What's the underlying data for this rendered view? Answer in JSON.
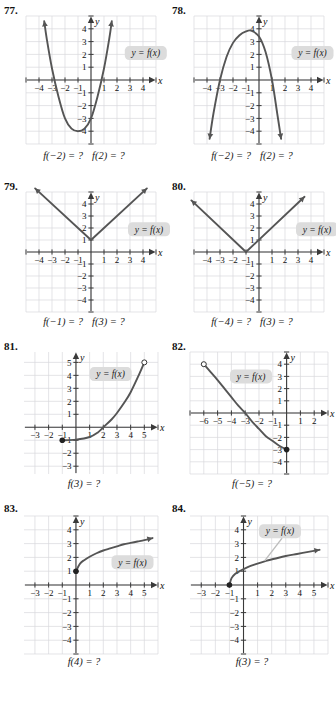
{
  "page": {
    "background": "#ffffff",
    "curve_color": "#555555",
    "grid_color": "#d8d8dc",
    "axis_color": "#3a3a3a",
    "callout_bg": "#dcdcdc",
    "columns": 2,
    "rows": 4
  },
  "label_text": "y = f(x)",
  "axis_names": {
    "x": "x",
    "y": "y"
  },
  "exercises": [
    {
      "number": "77.",
      "caption_parts": [
        "f(−2) = ?",
        "f(2) = ?"
      ],
      "axis_x_ticks": [
        "−4",
        "−3",
        "−2",
        "−1",
        "1",
        "2",
        "3",
        "4"
      ],
      "axis_y_ticks": [
        "4",
        "3",
        "2",
        "1",
        "−1",
        "−2",
        "−3",
        "−4"
      ],
      "chart_data": {
        "type": "line",
        "title": "Exercise 77 graph",
        "xlabel": "x",
        "ylabel": "y",
        "xlim": [
          -5,
          5
        ],
        "ylim": [
          -5,
          5
        ],
        "grid": true,
        "shape": "upward parabola, vertex near (-1, -4), roots at x = -3 and x = 1",
        "points": [
          [
            -3.6,
            4.6
          ],
          [
            -3.4,
            3.2
          ],
          [
            -3,
            0.9
          ],
          [
            -2.5,
            -1.3
          ],
          [
            -2,
            -3.0
          ],
          [
            -1.5,
            -3.8
          ],
          [
            -1,
            -4.0
          ],
          [
            -0.5,
            -3.8
          ],
          [
            0,
            -3.0
          ],
          [
            0.5,
            -1.3
          ],
          [
            1,
            0.9
          ],
          [
            1.4,
            3.2
          ],
          [
            1.6,
            4.6
          ]
        ],
        "arrows": [
          "start",
          "end"
        ],
        "label": "y = f(x)",
        "label_pos": [
          2.6,
          2.1
        ]
      }
    },
    {
      "number": "78.",
      "caption_parts": [
        "f(−2) = ?",
        "f(2) = ?"
      ],
      "axis_x_ticks": [
        "−4",
        "−3",
        "−2",
        "−1",
        "1",
        "2",
        "3",
        "4"
      ],
      "axis_y_ticks": [
        "4",
        "3",
        "2",
        "1",
        "−1",
        "−2",
        "−3",
        "−4"
      ],
      "chart_data": {
        "type": "line",
        "title": "Exercise 78 graph",
        "xlabel": "x",
        "ylabel": "y",
        "xlim": [
          -5,
          5
        ],
        "ylim": [
          -5,
          5
        ],
        "grid": true,
        "shape": "downward parabola, vertex near (-0.6, 3.8), roots at x = -3 and x = 1",
        "points": [
          [
            -3.8,
            -4.6
          ],
          [
            -3.5,
            -2.6
          ],
          [
            -3,
            0.0
          ],
          [
            -2.5,
            1.8
          ],
          [
            -2,
            2.9
          ],
          [
            -1.5,
            3.5
          ],
          [
            -1,
            3.8
          ],
          [
            -0.6,
            3.85
          ],
          [
            0,
            3.4
          ],
          [
            0.5,
            2.2
          ],
          [
            1,
            0.0
          ],
          [
            1.4,
            -2.6
          ],
          [
            1.7,
            -4.6
          ]
        ],
        "arrows": [
          "start",
          "end"
        ],
        "label": "y = f(x)",
        "label_pos": [
          2.5,
          2.1
        ]
      }
    },
    {
      "number": "79.",
      "caption_parts": [
        "f(−1) = ?",
        "f(3) = ?"
      ],
      "axis_x_ticks": [
        "−4",
        "−3",
        "−2",
        "−1",
        "1",
        "2",
        "3",
        "4"
      ],
      "axis_y_ticks": [
        "4",
        "3",
        "2",
        "1",
        "−1",
        "−2",
        "−3",
        "−4"
      ],
      "chart_data": {
        "type": "line",
        "title": "Exercise 79 graph",
        "xlabel": "x",
        "ylabel": "y",
        "xlim": [
          -5,
          5
        ],
        "ylim": [
          -5,
          5
        ],
        "grid": true,
        "shape": "absolute value V with vertex at (0, 1)",
        "points": [
          [
            -4.3,
            5.3
          ],
          [
            0,
            1
          ],
          [
            4.3,
            5.3
          ]
        ],
        "vertex": [
          0,
          1
        ],
        "arrows": [
          "start",
          "end"
        ],
        "label": "y = f(x)",
        "label_pos": [
          3.0,
          1.9
        ]
      }
    },
    {
      "number": "80.",
      "caption_parts": [
        "f(−4) = ?",
        "f(3) = ?"
      ],
      "axis_x_ticks": [
        "−4",
        "−3",
        "−2",
        "−1",
        "1",
        "2",
        "3",
        "4"
      ],
      "axis_y_ticks": [
        "4",
        "3",
        "2",
        "1",
        "−1",
        "−2",
        "−3",
        "−4"
      ],
      "chart_data": {
        "type": "line",
        "title": "Exercise 80 graph",
        "xlabel": "x",
        "ylabel": "y",
        "xlim": [
          -5,
          5
        ],
        "ylim": [
          -5,
          5
        ],
        "grid": true,
        "shape": "absolute value V with vertex at (-1, 0)",
        "points": [
          [
            -5.2,
            4.3
          ],
          [
            -1,
            0
          ],
          [
            3.5,
            4.6
          ]
        ],
        "vertex": [
          -1,
          0
        ],
        "arrows": [
          "start",
          "end"
        ],
        "label": "y = f(x)",
        "label_pos": [
          3.0,
          1.9
        ]
      }
    },
    {
      "number": "81.",
      "caption_parts": [
        "f(3) = ?"
      ],
      "axis_x_ticks": [
        "−3",
        "−2",
        "−1",
        "1",
        "2",
        "3",
        "4",
        "5"
      ],
      "axis_y_ticks": [
        "5",
        "4",
        "3",
        "2",
        "1",
        "−1",
        "−2",
        "−3"
      ],
      "chart_data": {
        "type": "line",
        "title": "Exercise 81 graph",
        "xlabel": "x",
        "ylabel": "y",
        "xlim": [
          -3.8,
          6
        ],
        "ylim": [
          -3.6,
          5.8
        ],
        "grid": true,
        "shape": "increasing exponential-like curve from closed point (-1,-1) to open point (5,5)",
        "points": [
          [
            -1,
            -1
          ],
          [
            0,
            -0.95
          ],
          [
            1,
            -0.75
          ],
          [
            1.6,
            -0.4
          ],
          [
            2,
            0.0
          ],
          [
            2.6,
            0.6
          ],
          [
            3,
            1.1
          ],
          [
            3.6,
            2.0
          ],
          [
            4,
            2.7
          ],
          [
            4.5,
            3.8
          ],
          [
            5,
            5
          ]
        ],
        "closed_point": [
          -1,
          -1
        ],
        "open_point": [
          5,
          5
        ],
        "arrows": [],
        "label": "y = f(x)",
        "label_pos": [
          1.0,
          4.1
        ]
      }
    },
    {
      "number": "82.",
      "caption_parts": [
        "f(−5) = ?"
      ],
      "axis_x_ticks": [
        "−6",
        "−5",
        "−4",
        "−3",
        "−2",
        "−1",
        "1",
        "2"
      ],
      "axis_y_ticks": [
        "4",
        "3",
        "2",
        "1",
        "−1",
        "−2",
        "−3",
        "−4"
      ],
      "chart_data": {
        "type": "line",
        "title": "Exercise 82 graph",
        "xlabel": "x",
        "ylabel": "y",
        "xlim": [
          -7,
          3
        ],
        "ylim": [
          -5,
          5
        ],
        "grid": true,
        "shape": "decreasing exponential-like curve from open point (-6,4) to closed point (0,-3)",
        "points": [
          [
            -6,
            4
          ],
          [
            -5.5,
            3.35
          ],
          [
            -5,
            2.7
          ],
          [
            -4.5,
            2.0
          ],
          [
            -4,
            1.3
          ],
          [
            -3.5,
            0.6
          ],
          [
            -3,
            0.0
          ],
          [
            -2.5,
            -0.7
          ],
          [
            -2,
            -1.3
          ],
          [
            -1.5,
            -1.9
          ],
          [
            -1,
            -2.3
          ],
          [
            -0.5,
            -2.7
          ],
          [
            0,
            -3
          ]
        ],
        "open_point": [
          -6,
          4
        ],
        "closed_point": [
          0,
          -3
        ],
        "arrows": [],
        "label": "y = f(x)",
        "label_pos": [
          -4.1,
          3.0
        ]
      }
    },
    {
      "number": "83.",
      "caption_parts": [
        "f(4) = ?"
      ],
      "axis_x_ticks": [
        "−3",
        "−2",
        "−1",
        "1",
        "2",
        "3",
        "4",
        "5"
      ],
      "axis_y_ticks": [
        "4",
        "3",
        "2",
        "1",
        "−1",
        "−2",
        "−3",
        "−4"
      ],
      "chart_data": {
        "type": "line",
        "title": "Exercise 83 graph",
        "xlabel": "x",
        "ylabel": "y",
        "xlim": [
          -3.8,
          6
        ],
        "ylim": [
          -5,
          5
        ],
        "grid": true,
        "shape": "square-root curve starting at closed point (0,1), rising to the right",
        "points": [
          [
            0,
            1
          ],
          [
            0.3,
            1.55
          ],
          [
            0.6,
            1.8
          ],
          [
            1,
            2.05
          ],
          [
            1.5,
            2.3
          ],
          [
            2,
            2.5
          ],
          [
            2.5,
            2.65
          ],
          [
            3,
            2.8
          ],
          [
            3.5,
            2.95
          ],
          [
            4,
            3.05
          ],
          [
            4.5,
            3.15
          ],
          [
            5,
            3.25
          ],
          [
            5.6,
            3.4
          ]
        ],
        "closed_point": [
          0,
          1
        ],
        "arrows": [
          "end"
        ],
        "label": "y = f(x)",
        "label_pos": [
          2.6,
          1.65
        ]
      }
    },
    {
      "number": "84.",
      "caption_parts": [
        "f(3) = ?"
      ],
      "axis_x_ticks": [
        "−3",
        "−2",
        "−1",
        "1",
        "2",
        "3",
        "4",
        "5"
      ],
      "axis_y_ticks": [
        "4",
        "3",
        "2",
        "1",
        "−1",
        "−2",
        "−3",
        "−4"
      ],
      "chart_data": {
        "type": "line",
        "title": "Exercise 84 graph",
        "xlabel": "x",
        "ylabel": "y",
        "xlim": [
          -3.8,
          6
        ],
        "ylim": [
          -5,
          5
        ],
        "grid": true,
        "shape": "square-root curve starting at closed point (-1,0), rising to the right, with leader line from label",
        "points": [
          [
            -1,
            0
          ],
          [
            -0.85,
            0.5
          ],
          [
            -0.6,
            0.8
          ],
          [
            -0.2,
            1.05
          ],
          [
            0.3,
            1.3
          ],
          [
            1,
            1.55
          ],
          [
            1.6,
            1.75
          ],
          [
            2.2,
            1.9
          ],
          [
            3,
            2.1
          ],
          [
            3.8,
            2.25
          ],
          [
            4.6,
            2.4
          ],
          [
            5.4,
            2.55
          ]
        ],
        "closed_point": [
          -1,
          0
        ],
        "arrows": [
          "end"
        ],
        "label": "y = f(x)",
        "label_pos": [
          1.1,
          3.9
        ],
        "leader_to": [
          1.5,
          1.75
        ]
      }
    }
  ]
}
